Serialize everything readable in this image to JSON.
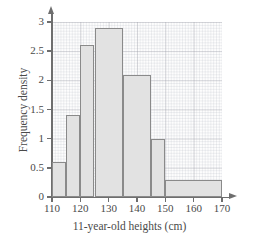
{
  "chart_data": {
    "type": "bar",
    "title": "",
    "xlabel": "11-year-old heights (cm)",
    "ylabel": "Frequency density",
    "xlim": [
      110,
      170
    ],
    "ylim": [
      0,
      3
    ],
    "grid": true,
    "legend": "none",
    "x_ticks": [
      "110",
      "120",
      "130",
      "140",
      "150",
      "160",
      "170"
    ],
    "x_tick_values": [
      110,
      120,
      130,
      140,
      150,
      160,
      170
    ],
    "y_ticks": [
      "0",
      "0.5",
      "1",
      "1.5",
      "2",
      "2.5",
      "3"
    ],
    "y_tick_values": [
      0,
      0.5,
      1,
      1.5,
      2,
      2.5,
      3
    ],
    "categories": [
      "110-115",
      "115-120",
      "120-125",
      "125-135",
      "135-145",
      "145-150",
      "150-170"
    ],
    "values": [
      0.6,
      1.4,
      2.6,
      2.9,
      2.1,
      1.0,
      0.3
    ],
    "bins": [
      {
        "label": "110-115",
        "start": 110,
        "end": 115,
        "frequency_density": 0.6
      },
      {
        "label": "115-120",
        "start": 115,
        "end": 120,
        "frequency_density": 1.4
      },
      {
        "label": "120-125",
        "start": 120,
        "end": 125,
        "frequency_density": 2.6
      },
      {
        "label": "125-135",
        "start": 125,
        "end": 135,
        "frequency_density": 2.9
      },
      {
        "label": "135-145",
        "start": 135,
        "end": 145,
        "frequency_density": 2.1
      },
      {
        "label": "145-150",
        "start": 145,
        "end": 150,
        "frequency_density": 1.0
      },
      {
        "label": "150-170",
        "start": 150,
        "end": 170,
        "frequency_density": 0.3
      }
    ],
    "colors": {
      "bar_fill": "#e2e2e2",
      "bar_stroke": "#8a8a8a",
      "axis": "#6e6e6e",
      "grid_major": "#9696a0",
      "grid_minor": "#b4b9c3",
      "text": "#4a4a4a",
      "background": "#ffffff"
    }
  }
}
